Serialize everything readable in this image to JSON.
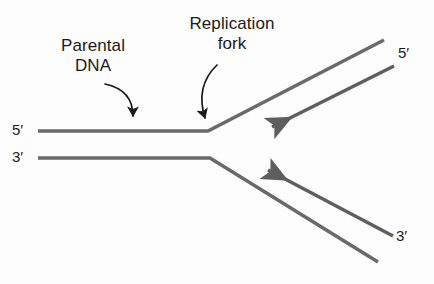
{
  "figure": {
    "background_color": "#fdfdfd",
    "strand_color": "#6a6a6a",
    "text_color": "#1a1a1a",
    "arrow_color": "#1a1a1a",
    "width": 434,
    "height": 284
  },
  "annotations": {
    "parental_dna": "Parental\nDNA",
    "parental_dna_line1": "Parental",
    "parental_dna_line2": "DNA",
    "replication_fork": "Replication\nfork",
    "replication_fork_line1": "Replication",
    "replication_fork_line2": "fork"
  },
  "end_labels": {
    "left_top": "5′",
    "left_bottom": "3′",
    "right_top": "5′",
    "right_bottom": "3′"
  },
  "strands": [
    {
      "name": "parental-template-top",
      "label_end": "5′",
      "path": "M 38,131 L 208,131 L 384,40",
      "has_arrowhead": false
    },
    {
      "name": "parental-template-bottom",
      "label_end": "3′",
      "path": "M 38,158 L 210,158 L 378,262",
      "has_arrowhead": false
    },
    {
      "name": "daughter-strand-top",
      "label_end": "5′",
      "path": "M 394,66 L 270,128",
      "has_arrowhead": true,
      "arrow_direction": "toward-fork"
    },
    {
      "name": "daughter-strand-bottom",
      "label_end": "3′",
      "path": "M 393,236 L 266,169",
      "has_arrowhead": true,
      "arrow_direction": "toward-fork"
    }
  ],
  "pointer_arrows": [
    {
      "name": "parental-dna-pointer",
      "from_label": "Parental DNA",
      "path": "M 106,85 Q 133,92 133,118"
    },
    {
      "name": "replication-fork-pointer",
      "from_label": "Replication fork",
      "path": "M 216,66 Q 196,86 206,120"
    }
  ]
}
